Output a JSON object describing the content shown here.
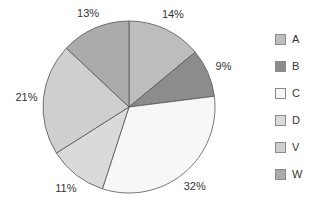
{
  "chart_data": {
    "type": "pie",
    "title": "",
    "categories": [
      "A",
      "B",
      "C",
      "D",
      "V",
      "W"
    ],
    "values": [
      14,
      9,
      32,
      11,
      21,
      13
    ],
    "labels": [
      "14%",
      "9%",
      "32%",
      "11%",
      "21%",
      "13%"
    ],
    "colors": [
      "#bdbdbd",
      "#8c8c8c",
      "#f7f7f7",
      "#dadada",
      "#cfcfcf",
      "#ababab"
    ],
    "start_angle_deg": 0,
    "direction": "clockwise",
    "legend_position": "right",
    "stroke_color": "#555555"
  },
  "legend": {
    "items": [
      {
        "label": "A",
        "color": "#bdbdbd"
      },
      {
        "label": "B",
        "color": "#8c8c8c"
      },
      {
        "label": "C",
        "color": "#f7f7f7"
      },
      {
        "label": "D",
        "color": "#dadada"
      },
      {
        "label": "V",
        "color": "#cfcfcf"
      },
      {
        "label": "W",
        "color": "#ababab"
      }
    ]
  }
}
